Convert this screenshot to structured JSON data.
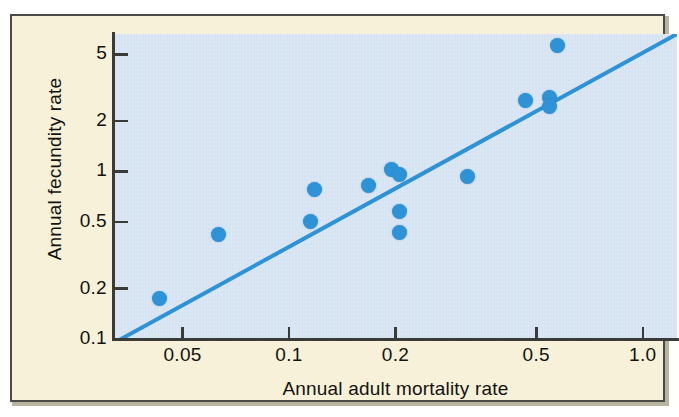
{
  "figure": {
    "background_color": "#f6f1d8",
    "plot_background_color": "#d5e3f2",
    "border_color": "#4a4a46",
    "accent_color": "#2e92d6",
    "text_color": "#14120f"
  },
  "chart_data": {
    "type": "scatter",
    "title": "",
    "xlabel": "Annual adult mortality rate",
    "ylabel": "Annual fecundity rate",
    "xscale": "log",
    "yscale": "log",
    "xlim": [
      0.032,
      1.25
    ],
    "ylim": [
      0.1,
      6.6
    ],
    "grid": false,
    "legend": null,
    "xticklabels": [
      "0.05",
      "0.1",
      "0.2",
      "0.5",
      "1.0"
    ],
    "xtickvalues": [
      0.05,
      0.1,
      0.2,
      0.5,
      1.0
    ],
    "yticklabels": [
      "5",
      "2",
      "1",
      "0.5",
      "0.2",
      "0.1"
    ],
    "ytickvalues": [
      5,
      2,
      1,
      0.5,
      0.2,
      0.1
    ],
    "points": [
      {
        "x": 0.043,
        "y": 0.175
      },
      {
        "x": 0.063,
        "y": 0.42
      },
      {
        "x": 0.115,
        "y": 0.5
      },
      {
        "x": 0.118,
        "y": 0.78
      },
      {
        "x": 0.168,
        "y": 0.82
      },
      {
        "x": 0.195,
        "y": 1.03
      },
      {
        "x": 0.205,
        "y": 0.96
      },
      {
        "x": 0.205,
        "y": 0.58
      },
      {
        "x": 0.205,
        "y": 0.43
      },
      {
        "x": 0.32,
        "y": 0.93
      },
      {
        "x": 0.465,
        "y": 2.65
      },
      {
        "x": 0.545,
        "y": 2.75
      },
      {
        "x": 0.545,
        "y": 2.45
      },
      {
        "x": 0.575,
        "y": 5.6
      }
    ],
    "trendline": {
      "type": "line",
      "color": "#2e92d6",
      "x": [
        0.0335,
        1.25
      ],
      "y": [
        0.1,
        6.6
      ]
    },
    "annotations": []
  }
}
